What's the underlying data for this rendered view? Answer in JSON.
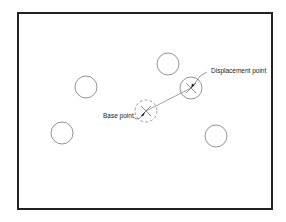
{
  "diagram": {
    "frame": {
      "x": 17,
      "y": 12,
      "width": 256,
      "height": 198,
      "stroke": "#222222"
    },
    "circles": [
      {
        "id": "circle-1",
        "cx": 86,
        "cy": 87,
        "r": 11
      },
      {
        "id": "circle-2",
        "cx": 62,
        "cy": 133,
        "r": 11
      },
      {
        "id": "circle-3",
        "cx": 168,
        "cy": 64,
        "r": 11
      },
      {
        "id": "circle-4",
        "cx": 216,
        "cy": 136,
        "r": 11
      }
    ],
    "base_circle": {
      "cx": 146,
      "cy": 111,
      "r": 11,
      "style": "dashed"
    },
    "displaced_circle": {
      "cx": 191,
      "cy": 88,
      "r": 11
    },
    "labels": {
      "base_point": "Base point",
      "displacement_point": "Displacement point"
    },
    "colors": {
      "line": "#555555",
      "text": "#222222"
    }
  }
}
